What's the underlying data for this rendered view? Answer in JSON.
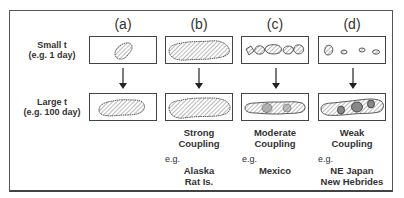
{
  "columns": [
    {
      "id": "a",
      "label": "(a)"
    },
    {
      "id": "b",
      "label": "(b)"
    },
    {
      "id": "c",
      "label": "(c)"
    },
    {
      "id": "d",
      "label": "(d)"
    }
  ],
  "rows": [
    {
      "line1": "Small t",
      "line2": "(e.g. 1 day)"
    },
    {
      "line1": "Large t",
      "line2": "(e.g. 100 day)"
    }
  ],
  "captions": [
    {
      "column": "b",
      "line1": "Strong",
      "line2": "Coupling",
      "eg": "e.g.",
      "ex1": "Alaska",
      "ex2": "Rat Is."
    },
    {
      "column": "c",
      "line1": "Moderate",
      "line2": "Coupling",
      "eg": "e.g.",
      "ex1": "Mexico",
      "ex2": ""
    },
    {
      "column": "d",
      "line1": "Weak",
      "line2": "Coupling",
      "eg": "e.g.",
      "ex1": "NE Japan",
      "ex2": "New Hebrides"
    }
  ],
  "icons": {
    "arrow": "down-arrow",
    "rupture": "hatched-rupture-zone",
    "asperity": "shaded-asperity"
  }
}
